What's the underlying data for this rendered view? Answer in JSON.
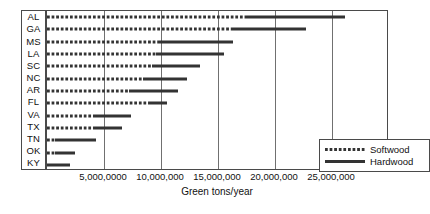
{
  "chart_data": {
    "type": "bar",
    "orientation": "horizontal",
    "stacked": true,
    "title": "",
    "xlabel": "Green tons/year",
    "ylabel": "",
    "xlim": [
      0,
      30000000
    ],
    "xticks": [
      5000000,
      10000000,
      15000000,
      20000000,
      25000000
    ],
    "xtick_labels": [
      "5,000,0000",
      "10,000,000",
      "15,000,000",
      "20,000,000",
      "25,000,000"
    ],
    "grid": "vertical",
    "legend_position": "lower-right",
    "categories": [
      "AL",
      "GA",
      "MS",
      "LA",
      "SC",
      "NC",
      "AR",
      "FL",
      "VA",
      "TX",
      "TN",
      "OK",
      "KY"
    ],
    "series": [
      {
        "name": "Softwood",
        "style": "dotted",
        "color": "#333333",
        "values": [
          17500000,
          16200000,
          9800000,
          9600000,
          9200000,
          8400000,
          7200000,
          9000000,
          4100000,
          4100000,
          700000,
          700000,
          0
        ]
      },
      {
        "name": "Hardwood",
        "style": "solid",
        "color": "#333333",
        "values": [
          8600000,
          6500000,
          6500000,
          5900000,
          4200000,
          3900000,
          4300000,
          1500000,
          3300000,
          2500000,
          3600000,
          1800000,
          2000000
        ]
      }
    ],
    "totals": [
      26100000,
      22700000,
      16300000,
      15500000,
      13400000,
      12300000,
      11500000,
      10500000,
      7400000,
      6600000,
      4300000,
      2500000,
      2000000
    ]
  },
  "legend": {
    "items": [
      {
        "label": "Softwood",
        "style": "soft"
      },
      {
        "label": "Hardwood",
        "style": "hard"
      }
    ]
  }
}
